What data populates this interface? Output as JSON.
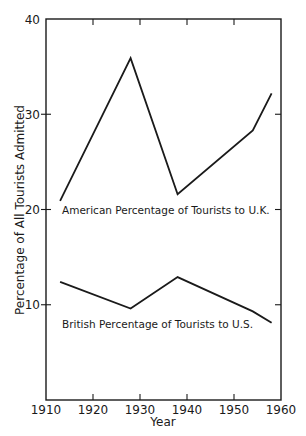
{
  "chart_data": {
    "type": "line",
    "title": "",
    "xlabel": "Year",
    "ylabel": "Percentage of All Tourists Admitted",
    "xlim": [
      1910,
      1960
    ],
    "ylim": [
      0,
      40
    ],
    "x_ticks": [
      1910,
      1920,
      1930,
      1940,
      1950,
      1960
    ],
    "y_ticks": [
      10,
      20,
      30,
      40
    ],
    "grid": false,
    "legend": "inline labels below each line",
    "series": [
      {
        "name": "American Percentage of Tourists to U.K.",
        "x": [
          1913,
          1928,
          1938,
          1954,
          1958
        ],
        "values": [
          20.9,
          35.9,
          21.6,
          28.3,
          32.2
        ]
      },
      {
        "name": "British Percentage of Tourists to U.S.",
        "x": [
          1913,
          1928,
          1938,
          1954,
          1958
        ],
        "values": [
          12.4,
          9.6,
          12.9,
          9.3,
          8.1
        ]
      }
    ]
  },
  "labels": {
    "xlabel": "Year",
    "ylabel": "Percentage of All Tourists Admitted",
    "american": "American Percentage of Tourists to U.K.",
    "british": "British Percentage of Tourists to U.S.",
    "x_ticks": [
      "1910",
      "1920",
      "1930",
      "1940",
      "1950",
      "1960"
    ],
    "y_ticks": [
      "10",
      "20",
      "30",
      "40"
    ]
  },
  "colors": {
    "ink": "#1a1a1a",
    "background": "#ffffff"
  }
}
